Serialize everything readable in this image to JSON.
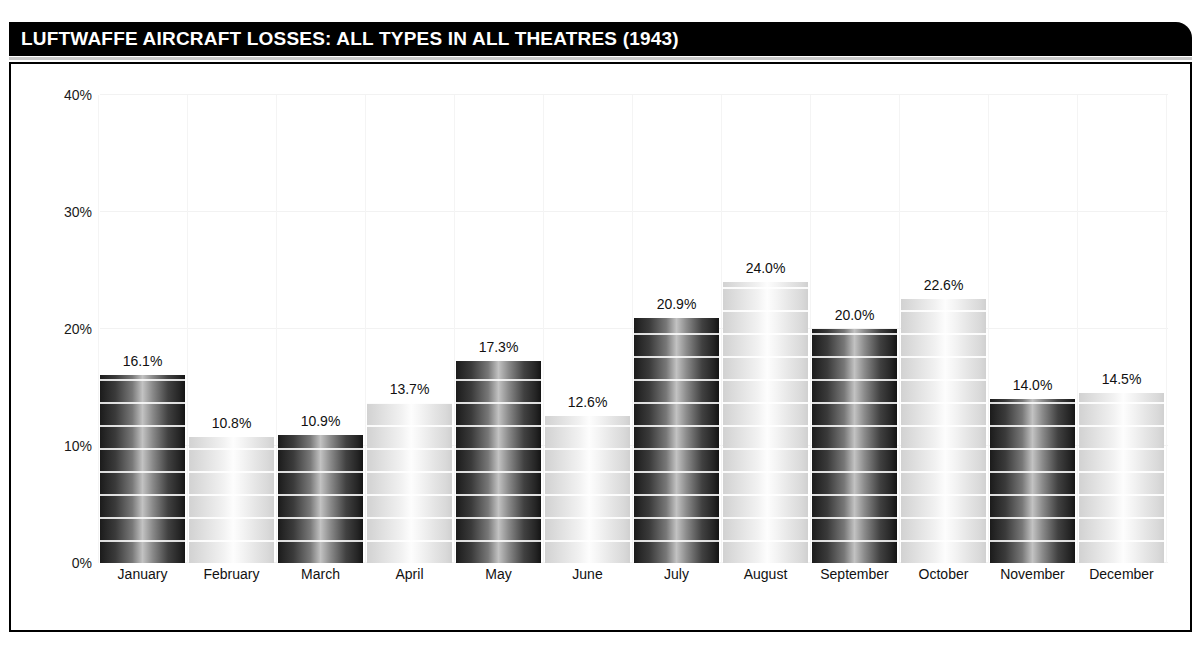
{
  "header": {
    "title": "LUFTWAFFE AIRCRAFT LOSSES: ALL TYPES IN ALL THEATRES (1943)",
    "background_color": "#000000",
    "text_color": "#ffffff"
  },
  "chart_data": {
    "type": "bar",
    "title": "LUFTWAFFE AIRCRAFT LOSSES: ALL TYPES IN ALL THEATRES (1943)",
    "xlabel": "",
    "ylabel": "",
    "ylim": [
      0,
      40
    ],
    "grid": true,
    "legend": "none",
    "y_tick_labels": [
      "0%",
      "10%",
      "20%",
      "30%",
      "40%"
    ],
    "y_ticks": [
      0,
      10,
      20,
      30,
      40
    ],
    "categories": [
      "January",
      "February",
      "March",
      "April",
      "May",
      "June",
      "July",
      "August",
      "September",
      "October",
      "November",
      "December"
    ],
    "values": [
      16.1,
      10.8,
      10.9,
      13.7,
      17.3,
      12.6,
      20.9,
      24.0,
      20.0,
      22.6,
      14.0,
      14.5
    ],
    "value_labels": [
      "16.1%",
      "10.8%",
      "10.9%",
      "13.7%",
      "17.3%",
      "12.6%",
      "20.9%",
      "24.0%",
      "20.0%",
      "22.6%",
      "14.0%",
      "14.5%"
    ],
    "bar_styles": [
      "dark",
      "light",
      "dark",
      "light",
      "dark",
      "light",
      "dark",
      "light",
      "dark",
      "light",
      "dark",
      "light"
    ],
    "colors": {
      "bar_dark_edge": "#1b1b1b",
      "bar_dark_center": "#c2c2c2",
      "bar_light_edge": "#d2d2d2",
      "bar_light_center": "#fdfdfd",
      "frame": "#000000",
      "gridline": "#f2f2f2",
      "text": "#111111"
    }
  }
}
